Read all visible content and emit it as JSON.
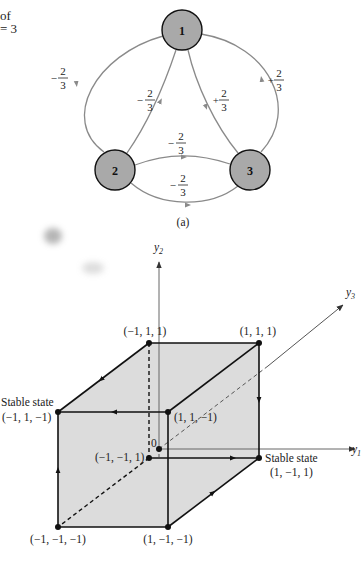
{
  "caption_fragment": {
    "line1": "of",
    "line2": "= 3"
  },
  "network": {
    "caption": "(a)",
    "nodes": [
      {
        "id": "1",
        "label": "1"
      },
      {
        "id": "2",
        "label": "2"
      },
      {
        "id": "3",
        "label": "3"
      }
    ],
    "edges": [
      {
        "from": "1",
        "to": "2",
        "path": "outer-left",
        "weight": {
          "sign": "−",
          "num": "2",
          "den": "3"
        }
      },
      {
        "from": "2",
        "to": "1",
        "path": "inner-left",
        "weight": {
          "sign": "−",
          "num": "2",
          "den": "3"
        }
      },
      {
        "from": "1",
        "to": "3",
        "path": "inner-right",
        "weight": {
          "sign": "+",
          "num": "2",
          "den": "3"
        }
      },
      {
        "from": "3",
        "to": "1",
        "path": "outer-right",
        "weight": {
          "sign": "+",
          "num": "2",
          "den": "3"
        }
      },
      {
        "from": "2",
        "to": "3",
        "path": "upper-middle",
        "weight": {
          "sign": "−",
          "num": "2",
          "den": "3"
        }
      },
      {
        "from": "2",
        "to": "3",
        "path": "lower-middle",
        "weight": {
          "sign": "−",
          "num": "2",
          "den": "3"
        }
      }
    ],
    "colors": {
      "node_fill": "#a9a9a9",
      "edge": "#8a8a8a"
    }
  },
  "cube": {
    "axes": {
      "y1": "y",
      "y1_sub": "1",
      "y2": "y",
      "y2_sub": "2",
      "y3": "y",
      "y3_sub": "3",
      "origin": "0"
    },
    "vertices": {
      "back_top_left": "(−1, 1, 1)",
      "back_top_right": "(1, 1, 1)",
      "front_top_left": "(−1, 1, −1)",
      "front_top_right": "(1, 1, −1)",
      "back_bottom_left": "(−1, −1, 1)",
      "back_bottom_right": "(1, −1, 1)",
      "front_bottom_left": "(−1, −1, −1)",
      "front_bottom_right": "(1, −1, −1)"
    },
    "stable_label": "Stable state",
    "colors": {
      "face_fill": "#dcdcdc",
      "edge": "#111111"
    }
  }
}
